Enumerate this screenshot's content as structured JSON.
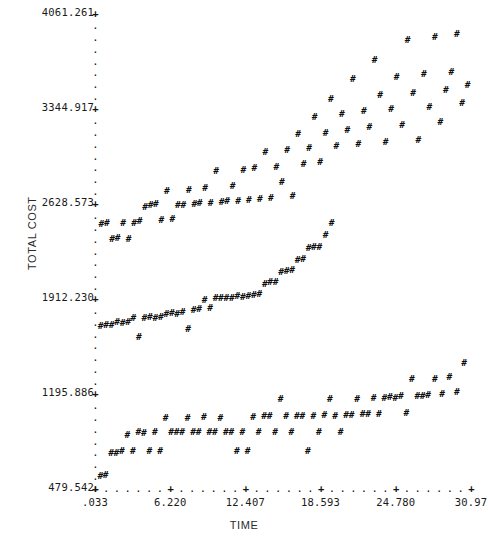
{
  "chart_data": {
    "type": "scatter",
    "title": "",
    "xlabel": "TIME",
    "ylabel": "TOTAL COST",
    "marker": "#",
    "major_tick_glyph": "+",
    "minor_tick_glyph": ".",
    "grid": false,
    "legend": null,
    "xlim": [
      0.033,
      30.97
    ],
    "ylim": [
      479.542,
      4061.261
    ],
    "xticks": [
      ".033",
      "6.220",
      "12.407",
      "18.593",
      "24.780",
      "30.97"
    ],
    "xtick_values": [
      0.033,
      6.22,
      12.407,
      18.593,
      24.78,
      30.97
    ],
    "yticks": [
      "479.542",
      "1195.886",
      "1912.230",
      "2628.573",
      "3344.917",
      "4061.261"
    ],
    "ytick_values": [
      479.542,
      1195.886,
      1912.23,
      2628.573,
      3344.917,
      4061.261
    ],
    "x_minor_per_major": 7,
    "y_minor_per_major": 8,
    "points": [
      [
        0.47,
        570
      ],
      [
        0.9,
        575
      ],
      [
        1.35,
        745
      ],
      [
        1.8,
        740
      ],
      [
        2.25,
        760
      ],
      [
        2.7,
        880
      ],
      [
        3.15,
        760
      ],
      [
        3.6,
        900
      ],
      [
        4.05,
        895
      ],
      [
        4.5,
        760
      ],
      [
        4.95,
        900
      ],
      [
        5.4,
        760
      ],
      [
        5.85,
        1010
      ],
      [
        6.3,
        905
      ],
      [
        6.75,
        900
      ],
      [
        7.2,
        900
      ],
      [
        7.65,
        1010
      ],
      [
        8.1,
        905
      ],
      [
        8.55,
        900
      ],
      [
        9.0,
        1015
      ],
      [
        9.45,
        900
      ],
      [
        9.9,
        900
      ],
      [
        10.35,
        1010
      ],
      [
        10.8,
        900
      ],
      [
        11.25,
        905
      ],
      [
        11.7,
        760
      ],
      [
        12.15,
        900
      ],
      [
        12.6,
        760
      ],
      [
        13.05,
        1015
      ],
      [
        13.5,
        900
      ],
      [
        13.95,
        1020
      ],
      [
        14.4,
        1020
      ],
      [
        14.85,
        905
      ],
      [
        15.3,
        1150
      ],
      [
        15.75,
        1020
      ],
      [
        16.2,
        900
      ],
      [
        16.65,
        1020
      ],
      [
        17.1,
        1020
      ],
      [
        17.55,
        760
      ],
      [
        18.0,
        1020
      ],
      [
        18.45,
        900
      ],
      [
        18.9,
        1030
      ],
      [
        19.35,
        1150
      ],
      [
        19.8,
        1025
      ],
      [
        20.25,
        900
      ],
      [
        20.7,
        1030
      ],
      [
        21.15,
        1030
      ],
      [
        21.6,
        1150
      ],
      [
        22.05,
        1035
      ],
      [
        22.5,
        1035
      ],
      [
        22.95,
        1160
      ],
      [
        23.4,
        1040
      ],
      [
        23.85,
        1160
      ],
      [
        24.3,
        1165
      ],
      [
        24.75,
        1160
      ],
      [
        25.2,
        1170
      ],
      [
        25.65,
        1045
      ],
      [
        26.1,
        1300
      ],
      [
        26.55,
        1175
      ],
      [
        27.0,
        1170
      ],
      [
        27.45,
        1180
      ],
      [
        28.0,
        1300
      ],
      [
        28.6,
        1190
      ],
      [
        29.2,
        1320
      ],
      [
        29.8,
        1200
      ],
      [
        30.4,
        1420
      ],
      [
        0.5,
        1700
      ],
      [
        0.95,
        1705
      ],
      [
        1.4,
        1710
      ],
      [
        1.85,
        1730
      ],
      [
        2.3,
        1725
      ],
      [
        2.75,
        1730
      ],
      [
        3.2,
        1760
      ],
      [
        3.65,
        1620
      ],
      [
        4.1,
        1760
      ],
      [
        4.55,
        1770
      ],
      [
        5.0,
        1765
      ],
      [
        5.45,
        1770
      ],
      [
        5.9,
        1790
      ],
      [
        6.35,
        1800
      ],
      [
        6.8,
        1795
      ],
      [
        7.25,
        1810
      ],
      [
        7.7,
        1680
      ],
      [
        8.15,
        1820
      ],
      [
        8.6,
        1830
      ],
      [
        9.05,
        1900
      ],
      [
        9.5,
        1840
      ],
      [
        9.95,
        1910
      ],
      [
        10.4,
        1910
      ],
      [
        10.85,
        1915
      ],
      [
        11.3,
        1915
      ],
      [
        11.75,
        1925
      ],
      [
        12.2,
        1920
      ],
      [
        12.65,
        1930
      ],
      [
        13.1,
        1935
      ],
      [
        13.55,
        1940
      ],
      [
        14.0,
        2020
      ],
      [
        14.45,
        2030
      ],
      [
        14.9,
        2035
      ],
      [
        15.35,
        2110
      ],
      [
        15.8,
        2115
      ],
      [
        16.25,
        2125
      ],
      [
        16.7,
        2200
      ],
      [
        17.15,
        2205
      ],
      [
        17.6,
        2290
      ],
      [
        18.05,
        2295
      ],
      [
        18.5,
        2300
      ],
      [
        19.0,
        2390
      ],
      [
        19.5,
        2480
      ],
      [
        0.55,
        2470
      ],
      [
        1.0,
        2475
      ],
      [
        1.45,
        2360
      ],
      [
        1.9,
        2365
      ],
      [
        2.35,
        2480
      ],
      [
        2.8,
        2360
      ],
      [
        3.25,
        2475
      ],
      [
        3.7,
        2490
      ],
      [
        4.15,
        2600
      ],
      [
        4.6,
        2610
      ],
      [
        5.05,
        2620
      ],
      [
        5.5,
        2500
      ],
      [
        5.95,
        2720
      ],
      [
        6.4,
        2505
      ],
      [
        6.85,
        2610
      ],
      [
        7.3,
        2615
      ],
      [
        7.75,
        2730
      ],
      [
        8.2,
        2620
      ],
      [
        8.65,
        2625
      ],
      [
        9.1,
        2745
      ],
      [
        9.55,
        2630
      ],
      [
        10.0,
        2870
      ],
      [
        10.45,
        2635
      ],
      [
        10.9,
        2640
      ],
      [
        11.35,
        2760
      ],
      [
        11.8,
        2645
      ],
      [
        12.25,
        2880
      ],
      [
        12.7,
        2650
      ],
      [
        13.15,
        2890
      ],
      [
        13.6,
        2660
      ],
      [
        14.05,
        3010
      ],
      [
        14.5,
        2670
      ],
      [
        14.95,
        2900
      ],
      [
        15.4,
        2790
      ],
      [
        15.85,
        3030
      ],
      [
        16.3,
        2680
      ],
      [
        16.75,
        3150
      ],
      [
        17.2,
        2920
      ],
      [
        17.65,
        3040
      ],
      [
        18.1,
        3280
      ],
      [
        18.55,
        2940
      ],
      [
        19.0,
        3160
      ],
      [
        19.45,
        3410
      ],
      [
        19.9,
        3060
      ],
      [
        20.35,
        3300
      ],
      [
        20.8,
        3180
      ],
      [
        21.25,
        3560
      ],
      [
        21.7,
        3070
      ],
      [
        22.15,
        3320
      ],
      [
        22.6,
        3200
      ],
      [
        23.05,
        3710
      ],
      [
        23.5,
        3440
      ],
      [
        23.95,
        3090
      ],
      [
        24.4,
        3340
      ],
      [
        24.85,
        3580
      ],
      [
        25.3,
        3220
      ],
      [
        25.75,
        3860
      ],
      [
        26.2,
        3460
      ],
      [
        26.65,
        3100
      ],
      [
        27.1,
        3600
      ],
      [
        27.55,
        3350
      ],
      [
        28.0,
        3880
      ],
      [
        28.45,
        3240
      ],
      [
        28.9,
        3480
      ],
      [
        29.35,
        3620
      ],
      [
        29.8,
        3900
      ],
      [
        30.25,
        3380
      ],
      [
        30.7,
        3520
      ]
    ]
  }
}
